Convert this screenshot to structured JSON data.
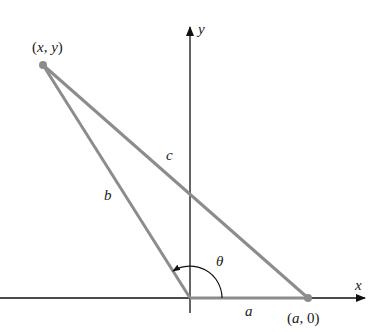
{
  "diagram": {
    "colors": {
      "axis": "#111111",
      "side": "#8c8c8c",
      "point": "#8c8c8c",
      "arc": "#111111"
    },
    "axes": {
      "x_label": "x",
      "y_label": "y"
    },
    "points": {
      "p_xy": {
        "label_open": "(",
        "var1": "x",
        "comma": ", ",
        "var2": "y",
        "label_close": ")"
      },
      "p_a0": {
        "label_open": "(",
        "var1": "a",
        "comma": ", ",
        "num": "0",
        "label_close": ")"
      }
    },
    "sides": {
      "a": "a",
      "b": "b",
      "c": "c"
    },
    "angle": {
      "label": "θ"
    }
  }
}
